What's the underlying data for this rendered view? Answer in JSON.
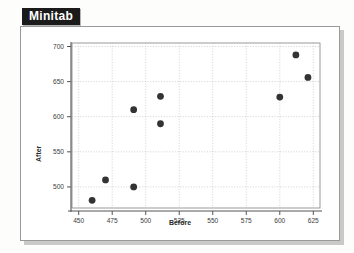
{
  "title": "Minitab",
  "figure": {
    "style": "scanned-textbook-figure",
    "frame_color": "#9a9a9a",
    "shadow_color": "#c9c9c6",
    "background": "#ffffff"
  },
  "chart_data": {
    "type": "scatter",
    "title": "",
    "xlabel": "Before",
    "ylabel": "After",
    "xlim": [
      445,
      630
    ],
    "ylim": [
      470,
      705
    ],
    "xticks": [
      450,
      475,
      500,
      525,
      550,
      575,
      600,
      625
    ],
    "yticks": [
      500,
      550,
      600,
      650,
      700
    ],
    "xticklabels": [
      "450",
      "475",
      "500",
      "525",
      "550",
      "575",
      "600",
      "625"
    ],
    "yticklabels": [
      "500",
      "550",
      "600",
      "650",
      "700"
    ],
    "grid": true,
    "grid_style": "dotted",
    "grid_color": "#b9b9b9",
    "legend": false,
    "marker": "filled-circle",
    "marker_color": "#333333",
    "marker_size": 3.4,
    "points": [
      {
        "x": 460,
        "y": 481
      },
      {
        "x": 470,
        "y": 510
      },
      {
        "x": 491,
        "y": 500
      },
      {
        "x": 491,
        "y": 610
      },
      {
        "x": 511,
        "y": 629
      },
      {
        "x": 511,
        "y": 590
      },
      {
        "x": 600,
        "y": 628
      },
      {
        "x": 612,
        "y": 688
      },
      {
        "x": 621,
        "y": 656
      }
    ]
  }
}
